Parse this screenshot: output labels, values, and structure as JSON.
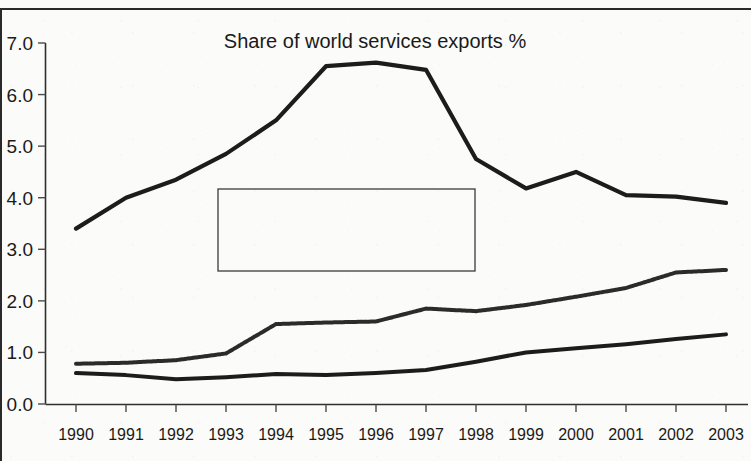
{
  "chart_data": {
    "type": "line",
    "title": "Share of world services exports %",
    "xlabel": "",
    "ylabel": "",
    "ylim": [
      0.0,
      7.0
    ],
    "ytick_step": 1.0,
    "ytick_labels": [
      "0.0",
      "1.0",
      "2.0",
      "3.0",
      "4.0",
      "5.0",
      "6.0",
      "7.0"
    ],
    "grid": false,
    "legend_position": "center-left-inside",
    "categories": [
      1990,
      1991,
      1992,
      1993,
      1994,
      1995,
      1996,
      1997,
      1998,
      1999,
      2000,
      2001,
      2002,
      2003
    ],
    "xtick_labels": [
      "1990",
      "1991",
      "1992",
      "1993",
      "1994",
      "1995",
      "1996",
      "1997",
      "1998",
      "1999",
      "2000",
      "2001",
      "2002",
      "2003"
    ],
    "xtick_last_clipped": true,
    "series": [
      {
        "name": "ASEAN (5)",
        "color": "#1c1c1c",
        "style": "solid",
        "width": 4.2,
        "values": [
          3.4,
          4.0,
          4.35,
          4.85,
          5.5,
          6.55,
          6.62,
          6.48,
          4.75,
          4.18,
          4.5,
          4.05,
          4.02,
          3.9
        ]
      },
      {
        "name": "CN",
        "color": "#2b2b2b",
        "style": "textured",
        "width": 4.0,
        "values": [
          0.78,
          0.8,
          0.85,
          0.98,
          1.55,
          1.58,
          1.6,
          1.85,
          1.8,
          1.92,
          2.08,
          2.25,
          2.55,
          2.6
        ]
      },
      {
        "name": "IN",
        "color": "#1c1c1c",
        "style": "solid",
        "width": 4.0,
        "values": [
          0.6,
          0.56,
          0.48,
          0.52,
          0.58,
          0.56,
          0.6,
          0.66,
          0.82,
          1.0,
          1.08,
          1.16,
          1.26,
          1.35
        ]
      }
    ]
  },
  "legend": {
    "entries": [
      {
        "label": "ASEAN (5)"
      },
      {
        "label": "CN"
      },
      {
        "label": "IN"
      }
    ]
  }
}
